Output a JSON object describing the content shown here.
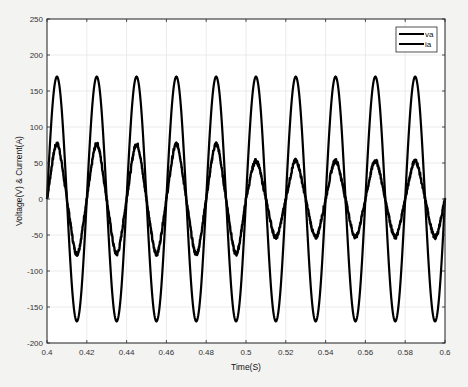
{
  "chart_data": {
    "type": "line",
    "title": "",
    "xlabel": "Time(S)",
    "ylabel": "Voltage(V) & Current(A)",
    "xlim": [
      0.4,
      0.6
    ],
    "ylim": [
      -200,
      250
    ],
    "xticks": [
      0.4,
      0.42,
      0.44,
      0.46,
      0.48,
      0.5,
      0.52,
      0.54,
      0.56,
      0.58,
      0.6
    ],
    "xtick_labels": [
      "0.4",
      "0.42",
      "0.44",
      "0.46",
      "0.48",
      "0.5",
      "0.52",
      "0.54",
      "0.56",
      "0.58",
      "0.6"
    ],
    "yticks": [
      -200,
      -150,
      -100,
      -50,
      0,
      50,
      100,
      150,
      200,
      250
    ],
    "ytick_labels": [
      "-200",
      "-150",
      "-100",
      "-50",
      "0",
      "50",
      "100",
      "150",
      "200",
      "250"
    ],
    "grid": true,
    "legend_position": "upper right",
    "frequency_hz": 50,
    "series": [
      {
        "name": "va",
        "color": "#000000",
        "waveform": "sine",
        "amplitude": 170,
        "phase_deg": 0,
        "peaks_t": [
          0.405,
          0.425,
          0.445,
          0.465,
          0.485,
          0.505,
          0.525,
          0.545,
          0.565,
          0.585
        ],
        "peak_value": 170,
        "trough_value": -170
      },
      {
        "name": "ia",
        "color": "#000000",
        "waveform": "sine (distorted, noisy)",
        "phase_deg": 0,
        "segments": [
          {
            "t_start": 0.4,
            "t_end": 0.5,
            "amplitude": 72
          },
          {
            "t_start": 0.5,
            "t_end": 0.6,
            "amplitude": 50
          }
        ],
        "peak_values_first_half": [
          75,
          73,
          72,
          75,
          76
        ],
        "peak_values_second_half": [
          55,
          52,
          50,
          52,
          52
        ]
      }
    ]
  },
  "legend": {
    "items": [
      {
        "label": "va"
      },
      {
        "label": "ia"
      }
    ]
  },
  "axes": {
    "xlabel": "Time(S)",
    "ylabel": "Voltage(V) & Current(A)"
  }
}
